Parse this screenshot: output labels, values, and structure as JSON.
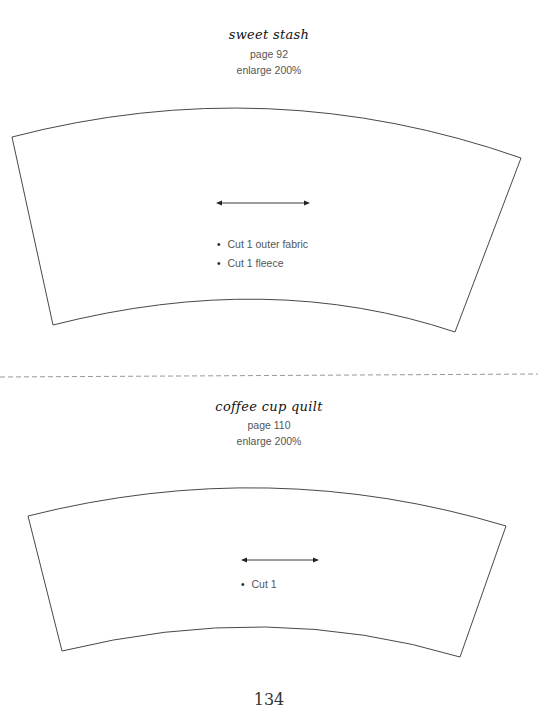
{
  "patterns": [
    {
      "title": "sweet stash",
      "page": "page 92",
      "enlarge": "enlarge 200%",
      "instructions": [
        "Cut 1 outer fabric",
        "Cut 1 fleece"
      ],
      "grainline": "double-arrow"
    },
    {
      "title": "coffee cup quilt",
      "page": "page 110",
      "enlarge": "enlarge 200%",
      "instructions": [
        "Cut 1"
      ],
      "grainline": "double-arrow"
    }
  ],
  "divider": "dashed-cut-line",
  "page_number": "134",
  "colors": {
    "outline": "#333333",
    "text": "#555555",
    "dash": "#999999"
  }
}
